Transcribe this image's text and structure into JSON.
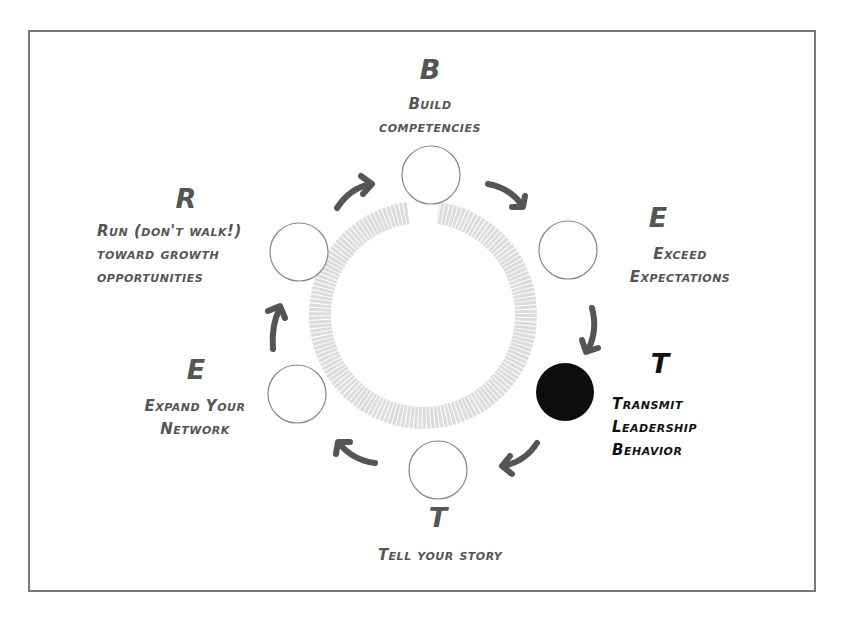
{
  "colors": {
    "border": "#7a7a7a",
    "text": "#555555",
    "highlight_text": "#111111",
    "arrow": "#555555",
    "ring": "#d8d8d8",
    "active_node": "#0d0d0d"
  },
  "steps": [
    {
      "letter": "B",
      "label_lines": [
        "Build",
        "competencies"
      ],
      "active": false
    },
    {
      "letter": "E",
      "label_lines": [
        "Exceed",
        "Expectations"
      ],
      "active": false
    },
    {
      "letter": "T",
      "label_lines": [
        "Transmit",
        "Leadership",
        "Behavior"
      ],
      "active": true
    },
    {
      "letter": "T",
      "label_lines": [
        "Tell your story"
      ],
      "active": false
    },
    {
      "letter": "E",
      "label_lines": [
        "Expand Your",
        "Network"
      ],
      "active": false
    },
    {
      "letter": "R",
      "label_lines": [
        "Run (don't walk!)",
        "toward growth",
        "opportunities"
      ],
      "active": false
    }
  ]
}
